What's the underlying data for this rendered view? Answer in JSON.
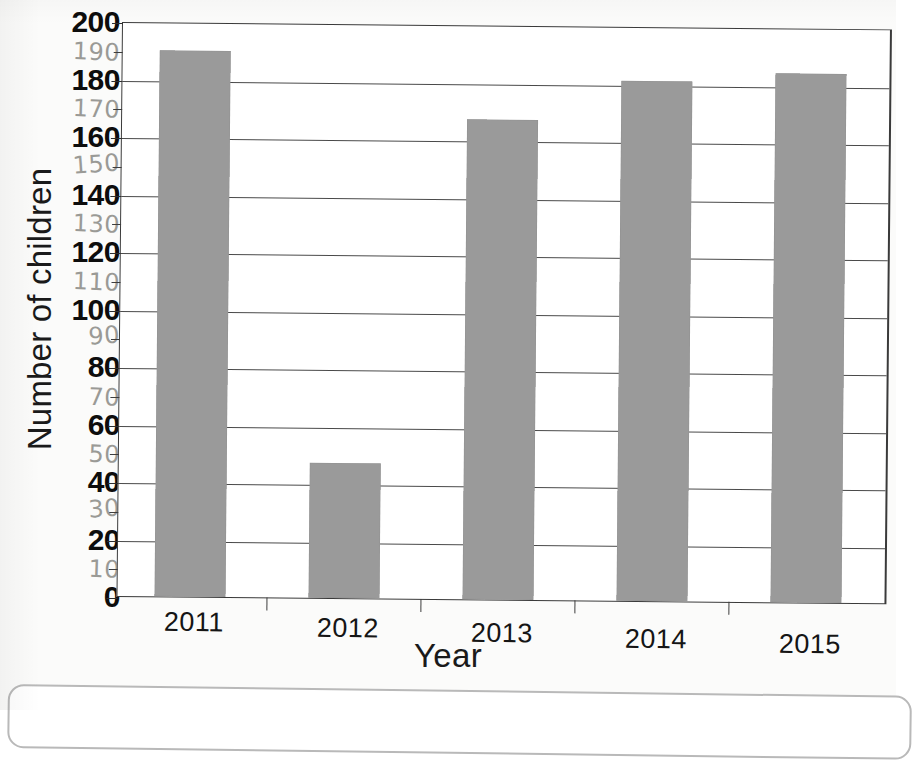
{
  "chart_data": {
    "type": "bar",
    "title": "",
    "xlabel": "Year",
    "ylabel": "Number of children",
    "categories": [
      "2011",
      "2012",
      "2013",
      "2014",
      "2015"
    ],
    "values": [
      190,
      47,
      167,
      181,
      184
    ],
    "ylim": [
      0,
      200
    ],
    "ytick_major_step": 20,
    "ytick_minor_step": 10,
    "grid": "horizontal-major-only",
    "legend": "none",
    "bar_color": "#9a9a9a",
    "axis_color": "#3a3a3a",
    "y_ticks_major": [
      "200",
      "180",
      "160",
      "140",
      "120",
      "100",
      "80",
      "60",
      "40",
      "20",
      "0"
    ],
    "y_ticks_minor_handwritten": [
      "190",
      "170",
      "150",
      "130",
      "110",
      "90",
      "70",
      "50",
      "30",
      "10"
    ]
  },
  "axes": {
    "y_title": "Number of children",
    "x_title": "Year"
  },
  "x_labels": [
    "2011",
    "2012",
    "2013",
    "2014",
    "2015"
  ]
}
